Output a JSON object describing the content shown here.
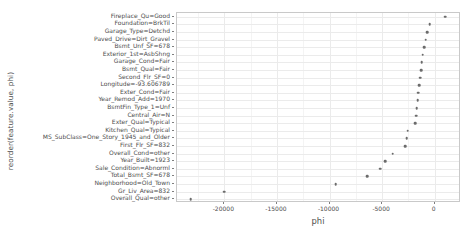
{
  "chart_data": {
    "type": "scatter",
    "title": "",
    "xlabel": "phi",
    "ylabel": "reorder(feature.value, phi)",
    "xlim": [
      -24500,
      2500
    ],
    "xticks": [
      -20000,
      -15000,
      -10000,
      -5000,
      0
    ],
    "xticklabels": [
      "-20000",
      "-15000",
      "-10000",
      "-5000",
      "0"
    ],
    "grid": true,
    "legend": "none",
    "point_color": "#6b6b6b",
    "categories": [
      "Fireplace_Qu=Good",
      "Foundation=BrkTil",
      "Garage_Type=Detchd",
      "Paved_Drive=Dirt_Gravel",
      "Bsmt_Unf_SF=678",
      "Exterior_1st=AsbShng",
      "Garage_Cond=Fair",
      "Bsmt_Qual=Fair",
      "Second_Flr_SF=0",
      "Longitude=-93.606789",
      "Exter_Cond=Fair",
      "Year_Remod_Add=1970",
      "BsmtFin_Type_1=Unf",
      "Central_Air=N",
      "Exter_Qual=Typical",
      "Kitchen_Qual=Typical",
      "MS_SubClass=One_Story_1945_and_Older",
      "First_Flr_SF=832",
      "Overall_Cond=other",
      "Year_Built=1923",
      "Sale_Condition=Abnorml",
      "Total_Bsmt_SF=678",
      "Neighborhood=Old_Town",
      "Gr_Liv_Area=832",
      "Overall_Qual=other"
    ],
    "values": [
      1000,
      -480,
      -700,
      -840,
      -980,
      -1130,
      -1220,
      -1300,
      -1400,
      -1480,
      -1560,
      -1620,
      -1700,
      -1780,
      -1860,
      -2560,
      -2680,
      -2800,
      -4000,
      -4700,
      -5200,
      -6400,
      -9400,
      -20000,
      -23200
    ]
  }
}
